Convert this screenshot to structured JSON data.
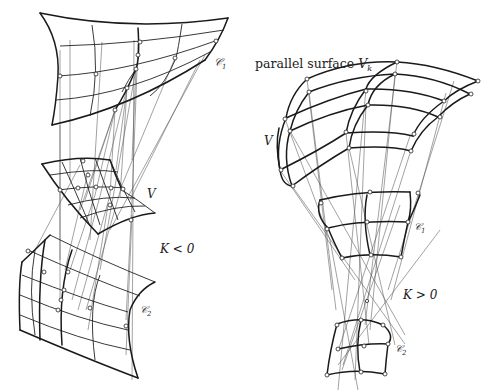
{
  "figure": {
    "left_panel": {
      "name": "negative-curvature",
      "labels": {
        "caustic_1": "𝒞",
        "caustic_1_sub": "1",
        "surface": "V",
        "curvature": "K < 0",
        "caustic_2": "𝒞",
        "caustic_2_sub": "2"
      }
    },
    "right_panel": {
      "name": "positive-curvature",
      "labels": {
        "parallel_surface": "parallel surface",
        "parallel_symbol": "V",
        "parallel_sub": "k",
        "surface": "V",
        "caustic_1": "𝒞",
        "caustic_1_sub": "1",
        "curvature": "K > 0",
        "caustic_2": "𝒞",
        "caustic_2_sub": "2"
      }
    },
    "colors": {
      "ink": "#1a1a1a",
      "background": "#ffffff"
    }
  }
}
